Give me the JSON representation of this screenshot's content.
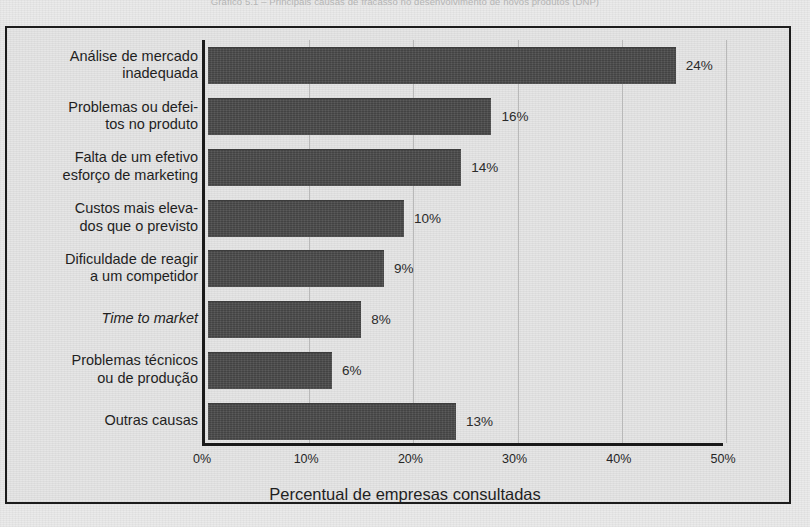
{
  "caption": "Gráfico 5.1 – Principais causas de fracasso no desenvolvimento de novos produtos (DNP)",
  "axis": {
    "xtitle": "Percentual de empresas consultadas",
    "ticks": [
      "0%",
      "10%",
      "20%",
      "30%",
      "40%",
      "50%"
    ]
  },
  "colors": {
    "bar": "#4b4b4b",
    "frame": "#1c1c1c",
    "background": "#e4e4e4",
    "gridline": "#b9b9b9",
    "text": "#1f1f1f"
  },
  "chart_data": {
    "type": "bar",
    "orientation": "horizontal",
    "title": "Gráfico 5.1 – Principais causas de fracasso no desenvolvimento de novos produtos (DNP)",
    "xlabel": "Percentual de empresas consultadas",
    "ylabel": "",
    "xlim": [
      0,
      50
    ],
    "xticks": [
      0,
      10,
      20,
      30,
      40,
      50
    ],
    "xtick_labels": [
      "0%",
      "10%",
      "20%",
      "30%",
      "40%",
      "50%"
    ],
    "grid": true,
    "legend": "none",
    "categories": [
      "Análise de mercado inadequada",
      "Problemas ou defeitos no produto",
      "Falta de um efetivo esforço de marketing",
      "Custos mais elevados que o previsto",
      "Dificuldade de reagir a um competidor",
      "Time to market",
      "Problemas técnicos ou de produção",
      "Outras causas"
    ],
    "values": [
      24,
      16,
      14,
      10,
      9,
      8,
      6,
      13
    ],
    "value_labels": [
      "24%",
      "16%",
      "14%",
      "10%",
      "9%",
      "8%",
      "6%",
      "13%"
    ],
    "drawn_bar_lengths_percent": [
      44.9,
      27.2,
      24.3,
      18.8,
      16.9,
      14.7,
      11.9,
      23.8
    ]
  },
  "categories": [
    {
      "lines": [
        "Análise de mercado",
        "inadequada"
      ],
      "value_label": "24%",
      "bar_percent": 44.9,
      "italic": false
    },
    {
      "lines": [
        "Problemas ou defei-",
        "tos no produto"
      ],
      "value_label": "16%",
      "bar_percent": 27.2,
      "italic": false
    },
    {
      "lines": [
        "Falta de um efetivo",
        "esforço de marketing"
      ],
      "value_label": "14%",
      "bar_percent": 24.3,
      "italic": false
    },
    {
      "lines": [
        "Custos mais eleva-",
        "dos que o previsto"
      ],
      "value_label": "10%",
      "bar_percent": 18.8,
      "italic": false
    },
    {
      "lines": [
        "Dificuldade de reagir",
        "a um competidor"
      ],
      "value_label": "9%",
      "bar_percent": 16.9,
      "italic": false
    },
    {
      "lines": [
        "Time to market"
      ],
      "value_label": "8%",
      "bar_percent": 14.7,
      "italic": true
    },
    {
      "lines": [
        "Problemas técnicos",
        "ou de produção"
      ],
      "value_label": "6%",
      "bar_percent": 11.9,
      "italic": false
    },
    {
      "lines": [
        "Outras causas"
      ],
      "value_label": "13%",
      "bar_percent": 23.8,
      "italic": false
    }
  ]
}
